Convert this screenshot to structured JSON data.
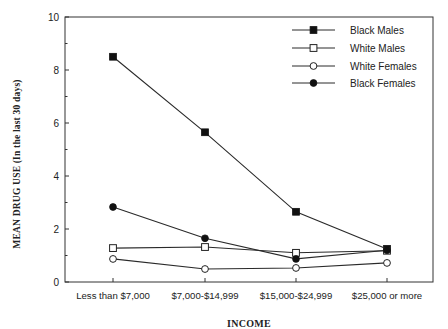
{
  "chart_data": {
    "type": "line",
    "title": "",
    "xlabel": "INCOME",
    "ylabel": "MEAN DRUG USE (In the last 30 days)",
    "categories": [
      "Less than $7,000",
      "$7,000-$14,999",
      "$15,000-$24,999",
      "$25,000 or more"
    ],
    "ylim": [
      0,
      10
    ],
    "yticks": [
      0,
      2,
      4,
      6,
      8,
      10
    ],
    "grid": false,
    "legend_position": "upper right",
    "series": [
      {
        "name": "Black Males",
        "marker": "filled-square",
        "values": [
          8.5,
          5.65,
          2.65,
          1.25
        ]
      },
      {
        "name": "White Males",
        "marker": "open-square",
        "values": [
          1.28,
          1.32,
          1.1,
          1.18
        ]
      },
      {
        "name": "White Females",
        "marker": "open-circle",
        "values": [
          0.87,
          0.49,
          0.53,
          0.72
        ]
      },
      {
        "name": "Black Females",
        "marker": "filled-circle",
        "values": [
          2.83,
          1.65,
          0.87,
          1.2
        ]
      }
    ]
  },
  "colors": {
    "line": "#2a2a2a",
    "axis": "#333333",
    "background": "#ffffff"
  }
}
